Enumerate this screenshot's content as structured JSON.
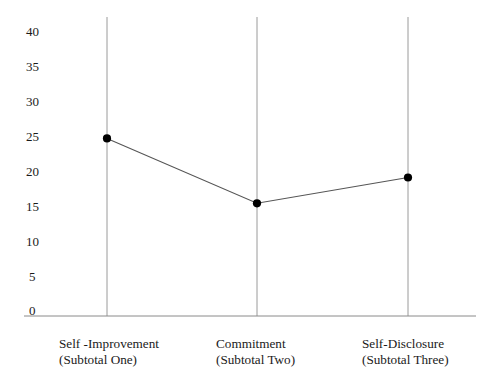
{
  "chart_data": {
    "type": "line",
    "title": "",
    "subtitle": "",
    "xlabel": "",
    "ylabel": "",
    "categories": [
      "Self -Improvement\n(Subtotal One)",
      "Commitment\n(Subtotal Two)",
      "Self-Disclosure\n(Subtotal Three)"
    ],
    "category_lines": [
      {
        "line1": "Self -Improvement",
        "line2": "(Subtotal One)"
      },
      {
        "line1": "Commitment",
        "line2": "(Subtotal Two)"
      },
      {
        "line1": "Self-Disclosure",
        "line2": "(Subtotal Three)"
      }
    ],
    "values": [
      24.6,
      15.3,
      19.0
    ],
    "x": [
      0,
      1,
      2
    ],
    "ylim": [
      0,
      40
    ],
    "yticks": [
      0,
      5,
      10,
      15,
      20,
      25,
      30,
      35,
      40
    ],
    "ytick_labels": [
      "0",
      "5",
      "10",
      "15",
      "20",
      "25",
      "30",
      "35",
      "40"
    ],
    "grid": "vertical-only",
    "legend": "none",
    "series": [
      {
        "name": "Mean score",
        "values": [
          24.6,
          15.3,
          19.0
        ],
        "marker": "filled-circle",
        "marker_color": "#000000",
        "line_color": "#555555"
      }
    ],
    "colors": {
      "background": "#ffffff",
      "axis": "#8a8a8a",
      "gridline": "#9a9a9a",
      "line": "#555555",
      "marker": "#000000",
      "text": "#1a1a1a"
    }
  }
}
